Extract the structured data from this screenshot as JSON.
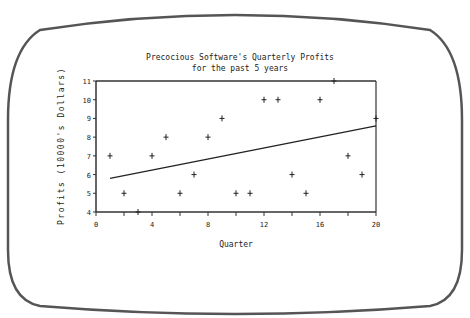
{
  "chart_data": {
    "type": "scatter",
    "title": "Precocious Software's Quarterly Profits",
    "subtitle": "for the past 5 years",
    "xlabel": "Quarter",
    "ylabel": "Profits (10000's Dollars)",
    "xlim": [
      0,
      20
    ],
    "ylim": [
      4,
      11
    ],
    "xticks": [
      0,
      4,
      8,
      12,
      16,
      20
    ],
    "yticks": [
      4,
      5,
      6,
      7,
      8,
      9,
      10,
      11
    ],
    "grid": false,
    "legend": null,
    "series": [
      {
        "name": "Profits",
        "marker": "+",
        "x": [
          1,
          2,
          3,
          4,
          5,
          6,
          7,
          8,
          9,
          10,
          11,
          12,
          13,
          14,
          15,
          16,
          17,
          18,
          19,
          20
        ],
        "y": [
          7,
          5,
          4,
          7,
          8,
          5,
          6,
          8,
          9,
          5,
          5,
          10,
          10,
          6,
          5,
          10,
          11,
          7,
          6,
          9
        ]
      },
      {
        "name": "Trend line",
        "type": "line",
        "x": [
          1,
          20
        ],
        "y": [
          5.8,
          8.6
        ]
      }
    ]
  }
}
